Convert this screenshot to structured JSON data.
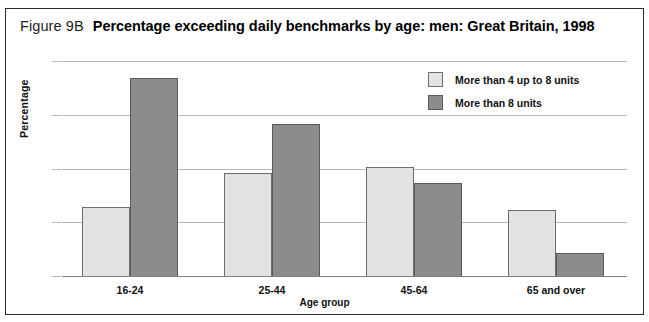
{
  "figure": {
    "label": "Figure 9B",
    "title": "Percentage exceeding daily benchmarks by age: men: Great Britain, 1998"
  },
  "chart_data": {
    "type": "bar",
    "title": "Percentage exceeding daily benchmarks by age: men: Great Britain, 1998",
    "xlabel": "Age group",
    "ylabel": "Percentage",
    "categories": [
      "16-24",
      "25-44",
      "45-64",
      "65 and over"
    ],
    "series": [
      {
        "name": "More than 4 up to 8 units",
        "color": "#e2e2e2",
        "values": [
          13.0,
          19.3,
          20.4,
          12.4
        ]
      },
      {
        "name": "More than 8 units",
        "color": "#8c8c8c",
        "values": [
          37.1,
          28.4,
          17.5,
          4.5
        ]
      }
    ],
    "ylim": [
      0,
      40
    ],
    "yticks": [
      0,
      10,
      20,
      30,
      40
    ],
    "grid": true,
    "legend_position": "top-right"
  }
}
